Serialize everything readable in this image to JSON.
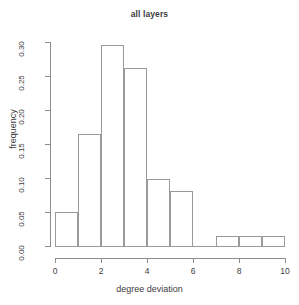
{
  "chart_data": {
    "type": "bar",
    "title": "all layers",
    "xlabel": "degree deviation",
    "ylabel": "frequency",
    "xlim": [
      0,
      10
    ],
    "ylim": [
      0.0,
      0.3
    ],
    "grid": false,
    "legend": null,
    "xticks": [
      "0",
      "2",
      "4",
      "6",
      "8",
      "10"
    ],
    "xtick_values": [
      0,
      2,
      4,
      6,
      8,
      10
    ],
    "yticks": [
      "0.00",
      "0.05",
      "0.10",
      "0.15",
      "0.20",
      "0.25",
      "0.30"
    ],
    "ytick_values": [
      0.0,
      0.05,
      0.1,
      0.15,
      0.2,
      0.25,
      0.3
    ],
    "bin_edges": [
      0,
      1,
      2,
      3,
      4,
      5,
      6,
      7,
      8,
      9,
      10
    ],
    "categories": [
      "0-1",
      "1-2",
      "2-3",
      "3-4",
      "4-5",
      "5-6",
      "6-7",
      "7-8",
      "8-9",
      "9-10"
    ],
    "values": [
      0.05,
      0.164,
      0.295,
      0.262,
      0.098,
      0.081,
      0.0,
      0.015,
      0.015,
      0.015
    ],
    "bar_color": "none",
    "bar_edge_color": "#9a9a9a",
    "axis_color": "#8e8e8e",
    "text_color": "#3d3d3d",
    "background": "#ffffff"
  }
}
